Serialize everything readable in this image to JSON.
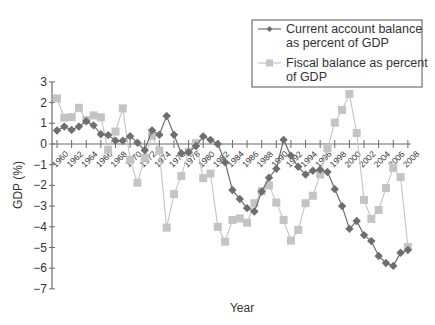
{
  "chart_data": {
    "type": "line",
    "title": "",
    "xlabel": "Year",
    "ylabel": "GDP (%)",
    "ylim": [
      -7,
      3
    ],
    "xlim": [
      1960,
      2008
    ],
    "grid": false,
    "legend_position": "upper right",
    "y_ticks": [
      "3",
      "2",
      "1",
      "0",
      "−1",
      "−2",
      "−3",
      "−4",
      "−5",
      "−6",
      "−7"
    ],
    "x_tick_labels": [
      "1960",
      "1962",
      "1964",
      "1966",
      "1968",
      "1970",
      "1972",
      "1974",
      "1976",
      "1978",
      "1980",
      "1982",
      "1984",
      "1986",
      "1988",
      "1990",
      "1992",
      "1994",
      "1996",
      "1998",
      "2000",
      "2002",
      "2004",
      "2006",
      "2008"
    ],
    "x": [
      1960,
      1961,
      1962,
      1963,
      1964,
      1965,
      1966,
      1967,
      1968,
      1969,
      1970,
      1971,
      1972,
      1973,
      1974,
      1975,
      1976,
      1977,
      1978,
      1979,
      1980,
      1981,
      1982,
      1983,
      1984,
      1985,
      1986,
      1987,
      1988,
      1989,
      1990,
      1991,
      1992,
      1993,
      1994,
      1995,
      1996,
      1997,
      1998,
      1999,
      2000,
      2001,
      2002,
      2003,
      2004,
      2005,
      2006,
      2007,
      2008
    ],
    "series": [
      {
        "name": "Current account balance as percent of GDP",
        "marker": "diamond",
        "color": "#6e6e6e",
        "values": [
          0.65,
          0.84,
          0.68,
          0.84,
          1.1,
          0.9,
          0.47,
          0.43,
          0.16,
          0.16,
          0.38,
          0.06,
          -0.3,
          0.66,
          0.45,
          1.35,
          0.45,
          -0.45,
          -0.4,
          -0.1,
          0.37,
          0.2,
          0.0,
          -0.88,
          -2.22,
          -2.66,
          -3.1,
          -3.26,
          -2.3,
          -1.63,
          -1.2,
          0.2,
          -0.56,
          -1.1,
          -1.47,
          -1.29,
          -1.24,
          -1.35,
          -2.18,
          -3.0,
          -4.1,
          -3.72,
          -4.4,
          -4.69,
          -5.41,
          -5.75,
          -5.89,
          -5.25,
          -5.12
        ]
      },
      {
        "name": "Fiscal balance as percent of GDP",
        "marker": "square",
        "color": "#c4c4c4",
        "values": [
          2.2,
          1.27,
          1.3,
          1.75,
          1.15,
          1.38,
          1.29,
          -0.29,
          0.6,
          1.72,
          -0.77,
          -1.87,
          -0.66,
          0.38,
          -0.32,
          -4.04,
          -2.42,
          -1.55,
          -0.37,
          0.04,
          -1.65,
          -1.43,
          -4.0,
          -4.72,
          -3.67,
          -3.6,
          -3.8,
          -2.86,
          -2.28,
          -2.0,
          -2.83,
          -3.67,
          -4.67,
          -4.15,
          -2.86,
          -2.5,
          -1.47,
          -0.21,
          1.03,
          1.64,
          2.42,
          0.53,
          -2.7,
          -3.62,
          -3.19,
          -2.13,
          -1.16,
          -1.6,
          -4.98
        ]
      }
    ]
  },
  "legend": {
    "items": [
      {
        "line1": "Current account balance",
        "line2": "as percent of GDP"
      },
      {
        "line1": "Fiscal balance as percent",
        "line2": "of GDP"
      }
    ]
  },
  "axes": {
    "x_title": "Year",
    "y_title": "GDP (%)"
  }
}
